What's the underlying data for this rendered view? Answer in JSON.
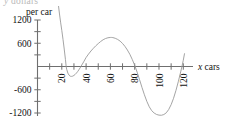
{
  "chart_data": {
    "type": "line",
    "title": "",
    "subtitle": "",
    "ylabel": "per car",
    "xlabel": "x cars",
    "xlabel_symbol": "x",
    "xlabel_word": "cars",
    "clipped_top_label": "y dollars",
    "xlim": [
      0,
      128
    ],
    "ylim": [
      -1400,
      1400
    ],
    "x_ticks": [
      10,
      20,
      30,
      40,
      50,
      60,
      70,
      80,
      90,
      100,
      110,
      120
    ],
    "x_tick_labels": [
      "",
      "20",
      "",
      "40",
      "",
      "60",
      "",
      "80",
      "",
      "100",
      "",
      "120"
    ],
    "x_labeled_ticks": [
      {
        "value": 20,
        "label": "20"
      },
      {
        "value": 40,
        "label": "40"
      },
      {
        "value": 60,
        "label": "60"
      },
      {
        "value": 80,
        "label": "80"
      },
      {
        "value": 100,
        "label": "100"
      },
      {
        "value": 120,
        "label": "120"
      }
    ],
    "x_tick_label_rotation_deg": -90,
    "y_ticks": [
      -1200,
      -900,
      -600,
      -300,
      0,
      300,
      600,
      900,
      1200
    ],
    "y_tick_labels": [
      "-1200",
      "",
      "-600",
      "",
      "",
      "",
      "600",
      "",
      "1200"
    ],
    "y_labeled_ticks": [
      {
        "value": 1200,
        "label": "1200"
      },
      {
        "value": 600,
        "label": "600"
      },
      {
        "value": -600,
        "label": "-600"
      },
      {
        "value": -1200,
        "label": "-1200"
      }
    ],
    "grid": false,
    "legend": null,
    "legend_position": "none",
    "line_color": "#9a9a9a",
    "axis_color": "#6f6f6f",
    "text_color": "#111111",
    "background_color": "#ffffff",
    "series": [
      {
        "name": "cost per car",
        "points": [
          [
            14.0,
            2600
          ],
          [
            15.0,
            2250
          ],
          [
            16.0,
            1930
          ],
          [
            17.0,
            1640
          ],
          [
            18.0,
            1380
          ],
          [
            19.0,
            1145
          ],
          [
            20.0,
            930
          ],
          [
            21.0,
            700
          ],
          [
            22.0,
            450
          ],
          [
            23.0,
            180
          ],
          [
            23.6,
            0
          ],
          [
            24.0,
            -70
          ],
          [
            25.0,
            -170
          ],
          [
            26.0,
            -225
          ],
          [
            27.0,
            -250
          ],
          [
            28.0,
            -255
          ],
          [
            29.0,
            -248
          ],
          [
            30.0,
            -230
          ],
          [
            31.0,
            -205
          ],
          [
            32.0,
            -172
          ],
          [
            33.0,
            -133
          ],
          [
            34.0,
            -88
          ],
          [
            35.0,
            -38
          ],
          [
            35.8,
            0
          ],
          [
            36.0,
            14
          ],
          [
            38.0,
            120
          ],
          [
            40.0,
            232
          ],
          [
            42.0,
            320
          ],
          [
            44.0,
            400
          ],
          [
            46.0,
            470
          ],
          [
            48.0,
            535
          ],
          [
            50.0,
            592
          ],
          [
            52.0,
            645
          ],
          [
            54.0,
            690
          ],
          [
            56.0,
            722
          ],
          [
            58.0,
            742
          ],
          [
            60.0,
            750
          ],
          [
            61.0,
            750
          ],
          [
            62.0,
            746
          ],
          [
            64.0,
            728
          ],
          [
            66.0,
            698
          ],
          [
            68.0,
            655
          ],
          [
            70.0,
            595
          ],
          [
            72.0,
            518
          ],
          [
            74.0,
            425
          ],
          [
            76.0,
            315
          ],
          [
            78.0,
            182
          ],
          [
            80.0,
            30
          ],
          [
            80.4,
            0
          ],
          [
            82.0,
            -145
          ],
          [
            84.0,
            -340
          ],
          [
            86.0,
            -540
          ],
          [
            88.0,
            -730
          ],
          [
            90.0,
            -900
          ],
          [
            92.0,
            -1040
          ],
          [
            94.0,
            -1140
          ],
          [
            96.0,
            -1200
          ],
          [
            98.0,
            -1238
          ],
          [
            100.0,
            -1255
          ],
          [
            102.0,
            -1258
          ],
          [
            104.0,
            -1240
          ],
          [
            106.0,
            -1195
          ],
          [
            108.0,
            -1110
          ],
          [
            110.0,
            -985
          ],
          [
            112.0,
            -820
          ],
          [
            114.0,
            -615
          ],
          [
            116.0,
            -380
          ],
          [
            118.0,
            -120
          ],
          [
            118.9,
            0
          ],
          [
            120.0,
            160
          ],
          [
            121.0,
            330
          ]
        ]
      }
    ]
  },
  "axes": {
    "y_axis_title": "per car",
    "x_axis_title_symbol": "x",
    "x_axis_title_word": "cars"
  }
}
